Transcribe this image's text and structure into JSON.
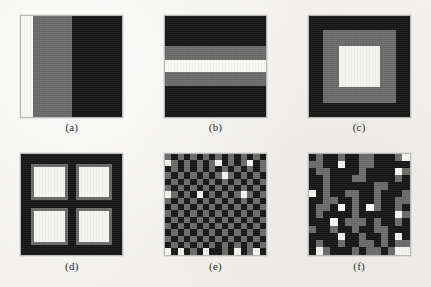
{
  "figure": {
    "background_color": "#f2f1ef",
    "panel_border_color": "#b9b8b4",
    "palette": {
      "black": "#151515",
      "gray": "#6a6a6a",
      "white": "#f4f4f0"
    },
    "panels": [
      {
        "id": "panel-a",
        "caption": "(a)",
        "pattern": "vertical-bands",
        "description": "Vertical bands: white, gray, black",
        "bands": [
          {
            "color": "#f7f7f3",
            "fraction": 12
          },
          {
            "color": "#6a6a6a",
            "fraction": 38
          },
          {
            "color": "#151515",
            "fraction": 50
          }
        ]
      },
      {
        "id": "panel-b",
        "caption": "(b)",
        "pattern": "horizontal-bands",
        "description": "Horizontal stripes: black, gray, white, gray, black",
        "bands": [
          {
            "color": "#151515",
            "fraction": 30
          },
          {
            "color": "#6a6a6a",
            "fraction": 14
          },
          {
            "color": "#f7f7f3",
            "fraction": 11
          },
          {
            "color": "#6a6a6a",
            "fraction": 14
          },
          {
            "color": "#151515",
            "fraction": 31
          }
        ]
      },
      {
        "id": "panel-c",
        "caption": "(c)",
        "pattern": "concentric-squares",
        "description": "Concentric squares: black outer, gray middle, white inner",
        "rings": [
          {
            "color": "#151515",
            "size_pct": 100
          },
          {
            "color": "#6a6a6a",
            "size_pct": 72
          },
          {
            "color": "#f4f4f0",
            "size_pct": 40
          }
        ]
      },
      {
        "id": "panel-d",
        "caption": "(d)",
        "pattern": "four-squares",
        "description": "Two-by-two grid of white squares with gray borders on black",
        "background": "#151515",
        "border_color": "#6a6a6a",
        "fill_color": "#f4f4f0",
        "count": 4
      },
      {
        "id": "panel-e",
        "caption": "(e)",
        "pattern": "checkerboard",
        "description": "Regular checkerboard of black and gray cells with scattered white cells",
        "columns": 16,
        "rows": 16,
        "cells": [
          "g",
          "k",
          "g",
          "k",
          "g",
          "k",
          "g",
          "k",
          "g",
          "k",
          "g",
          "k",
          "g",
          "k",
          "g",
          "k",
          "w",
          "g",
          "k",
          "g",
          "k",
          "g",
          "k",
          "g",
          "w",
          "k",
          "g",
          "k",
          "g",
          "w",
          "k",
          "g",
          "k",
          "g",
          "k",
          "g",
          "k",
          "g",
          "k",
          "g",
          "k",
          "g",
          "k",
          "g",
          "k",
          "g",
          "k",
          "g",
          "g",
          "k",
          "g",
          "k",
          "g",
          "k",
          "g",
          "k",
          "g",
          "w",
          "g",
          "k",
          "g",
          "k",
          "g",
          "k",
          "k",
          "g",
          "k",
          "g",
          "k",
          "g",
          "k",
          "g",
          "k",
          "g",
          "k",
          "g",
          "k",
          "g",
          "k",
          "g",
          "g",
          "k",
          "g",
          "k",
          "g",
          "k",
          "g",
          "k",
          "g",
          "k",
          "g",
          "k",
          "g",
          "k",
          "g",
          "k",
          "w",
          "g",
          "k",
          "g",
          "k",
          "w",
          "k",
          "g",
          "k",
          "g",
          "k",
          "g",
          "w",
          "g",
          "k",
          "g",
          "g",
          "k",
          "g",
          "k",
          "g",
          "k",
          "g",
          "k",
          "g",
          "k",
          "g",
          "k",
          "g",
          "k",
          "g",
          "k",
          "k",
          "g",
          "k",
          "g",
          "k",
          "g",
          "k",
          "g",
          "k",
          "g",
          "k",
          "g",
          "k",
          "g",
          "k",
          "g",
          "g",
          "k",
          "g",
          "k",
          "g",
          "k",
          "g",
          "k",
          "g",
          "k",
          "g",
          "k",
          "g",
          "k",
          "g",
          "k",
          "k",
          "g",
          "k",
          "g",
          "k",
          "g",
          "k",
          "g",
          "k",
          "g",
          "k",
          "g",
          "k",
          "g",
          "k",
          "g",
          "g",
          "k",
          "g",
          "k",
          "g",
          "k",
          "g",
          "k",
          "g",
          "k",
          "g",
          "k",
          "g",
          "k",
          "g",
          "k",
          "k",
          "g",
          "k",
          "g",
          "k",
          "g",
          "k",
          "g",
          "k",
          "g",
          "k",
          "g",
          "k",
          "g",
          "k",
          "g",
          "g",
          "k",
          "g",
          "k",
          "g",
          "k",
          "g",
          "k",
          "g",
          "k",
          "g",
          "k",
          "g",
          "k",
          "g",
          "k",
          "k",
          "g",
          "k",
          "g",
          "k",
          "g",
          "k",
          "g",
          "k",
          "g",
          "k",
          "g",
          "k",
          "g",
          "k",
          "g",
          "w",
          "k",
          "w",
          "k",
          "g",
          "k",
          "w",
          "k",
          "k",
          "g",
          "k",
          "w",
          "k",
          "g",
          "w",
          "k"
        ]
      },
      {
        "id": "panel-f",
        "caption": "(f)",
        "pattern": "random-blocks",
        "description": "Random block texture of black, gray and white cells",
        "columns": 14,
        "rows": 14,
        "cells": [
          "k",
          "g",
          "k",
          "k",
          "g",
          "k",
          "k",
          "g",
          "g",
          "k",
          "k",
          "k",
          "g",
          "w",
          "g",
          "g",
          "k",
          "k",
          "w",
          "k",
          "k",
          "g",
          "g",
          "k",
          "k",
          "k",
          "k",
          "k",
          "k",
          "g",
          "g",
          "k",
          "k",
          "k",
          "k",
          "g",
          "k",
          "k",
          "k",
          "k",
          "w",
          "g",
          "k",
          "k",
          "g",
          "k",
          "k",
          "k",
          "g",
          "g",
          "k",
          "k",
          "k",
          "k",
          "g",
          "k",
          "k",
          "k",
          "g",
          "k",
          "k",
          "k",
          "k",
          "k",
          "k",
          "g",
          "g",
          "k",
          "k",
          "k",
          "w",
          "k",
          "g",
          "k",
          "k",
          "g",
          "g",
          "k",
          "k",
          "g",
          "k",
          "k",
          "k",
          "g",
          "k",
          "k",
          "g",
          "g",
          "k",
          "k",
          "g",
          "k",
          "k",
          "g",
          "k",
          "k",
          "g",
          "g",
          "k",
          "g",
          "g",
          "k",
          "w",
          "k",
          "g",
          "k",
          "w",
          "g",
          "k",
          "k",
          "g",
          "k",
          "k",
          "g",
          "k",
          "k",
          "k",
          "k",
          "g",
          "k",
          "k",
          "k",
          "k",
          "k",
          "w",
          "g",
          "k",
          "k",
          "k",
          "w",
          "k",
          "g",
          "g",
          "g",
          "k",
          "g",
          "k",
          "k",
          "g",
          "k",
          "g",
          "k",
          "k",
          "g",
          "k",
          "k",
          "g",
          "k",
          "k",
          "g",
          "g",
          "k",
          "k",
          "k",
          "k",
          "k",
          "k",
          "k",
          "w",
          "k",
          "k",
          "g",
          "k",
          "k",
          "g",
          "k",
          "w",
          "k",
          "k",
          "g",
          "k",
          "k",
          "g",
          "k",
          "k",
          "g",
          "g",
          "k",
          "g",
          "k",
          "g",
          "g",
          "k",
          "w",
          "g",
          "k",
          "k",
          "k",
          "g",
          "k",
          "g",
          "g",
          "k",
          "g",
          "w",
          "w"
        ]
      }
    ]
  }
}
